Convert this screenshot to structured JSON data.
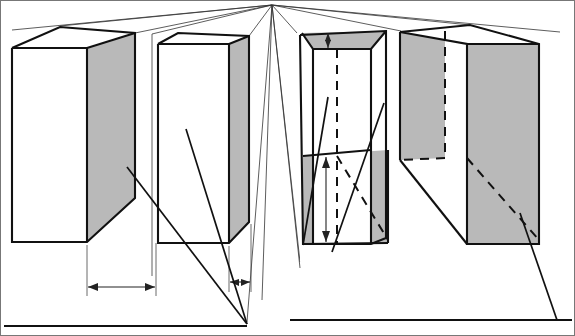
{
  "figure": {
    "name": "perspective-block-diagram",
    "type": "technical-line-drawing",
    "background_color": "#ffffff",
    "line_color": "#111111",
    "shaded_face_color": "#b9b9b9",
    "white_face_color": "#ffffff",
    "canvas": {
      "width": 575,
      "height": 336
    }
  },
  "vanishing_point": {
    "x": 272,
    "y": 5
  },
  "perspective_rays": [
    {
      "name": "ray-to-block1-top-back-left",
      "x2": 14,
      "y2": 27
    },
    {
      "name": "ray-to-block1-top-back-right",
      "x2": 96,
      "y2": 22
    },
    {
      "name": "ray-to-block2-top-back-left",
      "x2": 152,
      "y2": 34
    },
    {
      "name": "ray-to-block2-top-back-right",
      "x2": 233,
      "y2": 28
    },
    {
      "name": "ray-to-block3-left",
      "x2": 297,
      "y2": 32
    },
    {
      "name": "ray-to-block3-right",
      "x2": 300,
      "y2": 262
    },
    {
      "name": "ray-to-block3-inner",
      "x2": 335,
      "y2": 250
    },
    {
      "name": "ray-down-left-long",
      "x2": 262,
      "y2": 300
    },
    {
      "name": "ray-down-center",
      "x2": 247,
      "y2": 326
    },
    {
      "name": "ray-to-block4-left",
      "x2": 401,
      "y2": 30
    },
    {
      "name": "ray-to-block4-top",
      "x2": 470,
      "y2": 25
    },
    {
      "name": "ray-far-right",
      "x2": 540,
      "y2": 30
    }
  ],
  "blocks": [
    {
      "id": "block-1",
      "label": "leftmost-block",
      "front_face": {
        "fill": "#ffffff",
        "points": "12,48 87,48 87,242 12,242"
      },
      "side_face": {
        "fill": "#b9b9b9",
        "points": "87,48 135,33 135,198 87,242"
      },
      "top_face": {
        "fill": "#ffffff",
        "points": "12,48 87,48 135,33 60,27"
      }
    },
    {
      "id": "block-2",
      "label": "second-block",
      "front_face": {
        "fill": "#ffffff",
        "points": "158,44 229,44 229,243 158,243"
      },
      "side_face": {
        "fill": "#b9b9b9",
        "points": "229,44 249,36 249,222 229,243"
      },
      "top_face": {
        "fill": "#ffffff",
        "points": "158,44 229,44 249,36 178,34"
      }
    },
    {
      "id": "block-3",
      "label": "third-block-sectioned",
      "outer_shell": {
        "fill": "#ffffff",
        "points": "300,35 386,31 386,238 300,262"
      },
      "top_gray_band": {
        "fill": "#b9b9b9",
        "points": "302,33 386,31 371,48 313,48"
      },
      "inner_white": {
        "fill": "#ffffff",
        "points": "313,48 371,48 371,244 313,244"
      },
      "bottom_gray": {
        "fill": "#b9b9b9",
        "points": "303,156 388,150 388,243 303,243"
      },
      "dashed_vertical_x": 337,
      "has_top_dimension_arrow": true,
      "has_bottom_dimension_arrow": true
    },
    {
      "id": "block-4",
      "label": "rightmost-block",
      "far_face_gray": {
        "fill": "#b9b9b9",
        "points": "400,32 445,31 445,158 400,160"
      },
      "front_face_gray": {
        "fill": "#b9b9b9",
        "points": "467,44 539,44 539,244 467,244"
      },
      "top_face_white": {
        "fill": "#ffffff",
        "points": "400,32 467,44 539,44 470,25"
      },
      "has_dashed_diagonal": true
    }
  ],
  "dimensions": [
    {
      "id": "dim-width-1",
      "orientation": "horizontal",
      "style": "double-arrow",
      "x1": 87,
      "x2": 156,
      "y": 287,
      "extension_top": 245,
      "measures": "block-1-side-face-width"
    },
    {
      "id": "dim-width-2",
      "orientation": "horizontal",
      "style": "double-arrow",
      "x1": 229,
      "x2": 250,
      "y": 282,
      "extension_top": 246,
      "measures": "block-2-side-face-width"
    },
    {
      "id": "dim-height-top-3",
      "orientation": "vertical",
      "style": "double-arrow",
      "x": 328,
      "y1": 32,
      "y2": 48,
      "measures": "block-3-top-gray-band-height"
    },
    {
      "id": "dim-height-bottom-3",
      "orientation": "vertical",
      "style": "double-arrow",
      "x": 326,
      "y1": 157,
      "y2": 242,
      "measures": "block-3-lower-section-height"
    }
  ],
  "leaders": [
    {
      "id": "leader-left-v",
      "points": "127,167 247,326",
      "note": "left arm of V converging on baseline"
    },
    {
      "id": "leader-right-v",
      "points": "185,130 247,326",
      "note": "right arm of V converging on baseline"
    },
    {
      "id": "leader-block3-a",
      "points": "327,98 303,243",
      "note": "leader from inner section of block 3"
    },
    {
      "id": "leader-block3-b",
      "points": "383,104 330,249",
      "note": "second leader on block 3"
    },
    {
      "id": "leader-block4",
      "points": "519,212 556,320",
      "note": "leader from block 4 to baseline"
    }
  ],
  "baselines": [
    {
      "id": "baseline-left",
      "x1": 4,
      "x2": 247,
      "y": 326
    },
    {
      "id": "baseline-right",
      "x1": 290,
      "x2": 572,
      "y": 320
    }
  ],
  "border": {
    "stroke": "#555555",
    "width": 1
  }
}
